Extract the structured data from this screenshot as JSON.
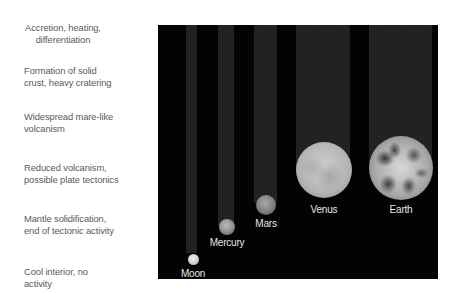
{
  "stages": [
    {
      "lines": [
        "Accretion, heating,",
        "differentiation"
      ],
      "align": "center"
    },
    {
      "lines": [
        "Formation of solid",
        "crust, heavy cratering"
      ],
      "align": "left"
    },
    {
      "lines": [
        "Widespread mare-like",
        "volcanism"
      ],
      "align": "left"
    },
    {
      "lines": [
        "Reduced volcanism,",
        "possible plate tectonics"
      ],
      "align": "left"
    },
    {
      "lines": [
        "Mantle solidification,",
        "end of tectonic activity"
      ],
      "align": "left"
    },
    {
      "lines": [
        "Cool interior, no",
        "activity"
      ],
      "align": "left"
    }
  ],
  "bodies": [
    {
      "name": "Moon",
      "stage_reached": "Cool interior, no activity"
    },
    {
      "name": "Mercury",
      "stage_reached": "Mantle solidification, end of tectonic activity"
    },
    {
      "name": "Mars",
      "stage_reached": "Mantle solidification, end of tectonic activity"
    },
    {
      "name": "Venus",
      "stage_reached": "Reduced volcanism, possible plate tectonics"
    },
    {
      "name": "Earth",
      "stage_reached": "Reduced volcanism, possible plate tectonics"
    }
  ],
  "colors": {
    "label_text": "#5a5a5a",
    "panel_background": "#030303",
    "trail": "#1e1e1e",
    "planet_label": "#e6e6e6"
  }
}
